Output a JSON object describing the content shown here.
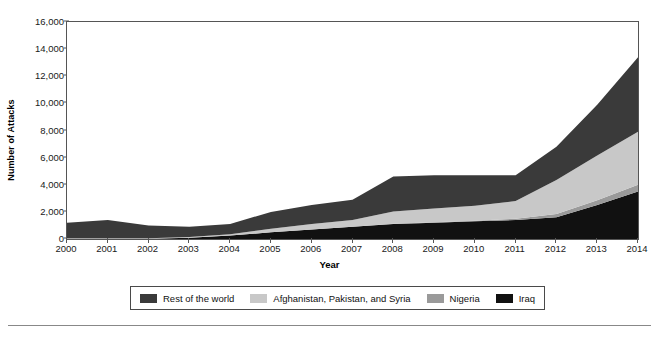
{
  "axes": {
    "ylabel": "Number of Attacks",
    "xlabel": "Year",
    "yticks": [
      "0",
      "2,000",
      "4,000",
      "6,000",
      "8,000",
      "10,000",
      "12,000",
      "14,000",
      "16,000"
    ],
    "ytick_values": [
      0,
      2000,
      4000,
      6000,
      8000,
      10000,
      12000,
      14000,
      16000
    ],
    "xticks": [
      "2000",
      "2001",
      "2002",
      "2003",
      "2004",
      "2005",
      "2006",
      "2007",
      "2008",
      "2009",
      "2010",
      "2011",
      "2012",
      "2013",
      "2014"
    ]
  },
  "legend": {
    "items": [
      {
        "label": "Rest of the world",
        "color": "#3a3a3a"
      },
      {
        "label": "Afghanistan, Pakistan, and Syria",
        "color": "#c8c8c8"
      },
      {
        "label": "Nigeria",
        "color": "#9a9a9a"
      },
      {
        "label": "Iraq",
        "color": "#111111"
      }
    ]
  },
  "chart_data": {
    "type": "area",
    "stacked": true,
    "title": "",
    "xlabel": "Year",
    "ylabel": "Number of Attacks",
    "xlim": [
      2000,
      2014
    ],
    "ylim": [
      0,
      16000
    ],
    "grid": false,
    "legend_position": "bottom",
    "x": [
      2000,
      2001,
      2002,
      2003,
      2004,
      2005,
      2006,
      2007,
      2008,
      2009,
      2010,
      2011,
      2012,
      2013,
      2014
    ],
    "series": [
      {
        "name": "Iraq",
        "color": "#111111",
        "values": [
          20,
          20,
          20,
          100,
          250,
          500,
          700,
          900,
          1100,
          1200,
          1300,
          1400,
          1600,
          2500,
          3500
        ]
      },
      {
        "name": "Nigeria",
        "color": "#9a9a9a",
        "values": [
          0,
          0,
          0,
          0,
          0,
          0,
          0,
          0,
          30,
          40,
          50,
          100,
          250,
          350,
          500
        ]
      },
      {
        "name": "Afghanistan, Pakistan, and Syria",
        "color": "#c8c8c8",
        "values": [
          30,
          30,
          30,
          50,
          100,
          250,
          400,
          500,
          900,
          1000,
          1100,
          1300,
          2500,
          3300,
          3900
        ]
      },
      {
        "name": "Rest of the world",
        "color": "#3a3a3a",
        "values": [
          1150,
          1350,
          950,
          750,
          750,
          1250,
          1400,
          1500,
          2570,
          2460,
          2250,
          1900,
          2450,
          3750,
          5500
        ]
      }
    ],
    "totals": [
      1200,
      1400,
      1000,
      900,
      1100,
      2000,
      2500,
      2900,
      4600,
      4700,
      4700,
      4700,
      6800,
      9900,
      13400
    ]
  },
  "style": {
    "frame_color": "#555555",
    "background": "#ffffff"
  }
}
